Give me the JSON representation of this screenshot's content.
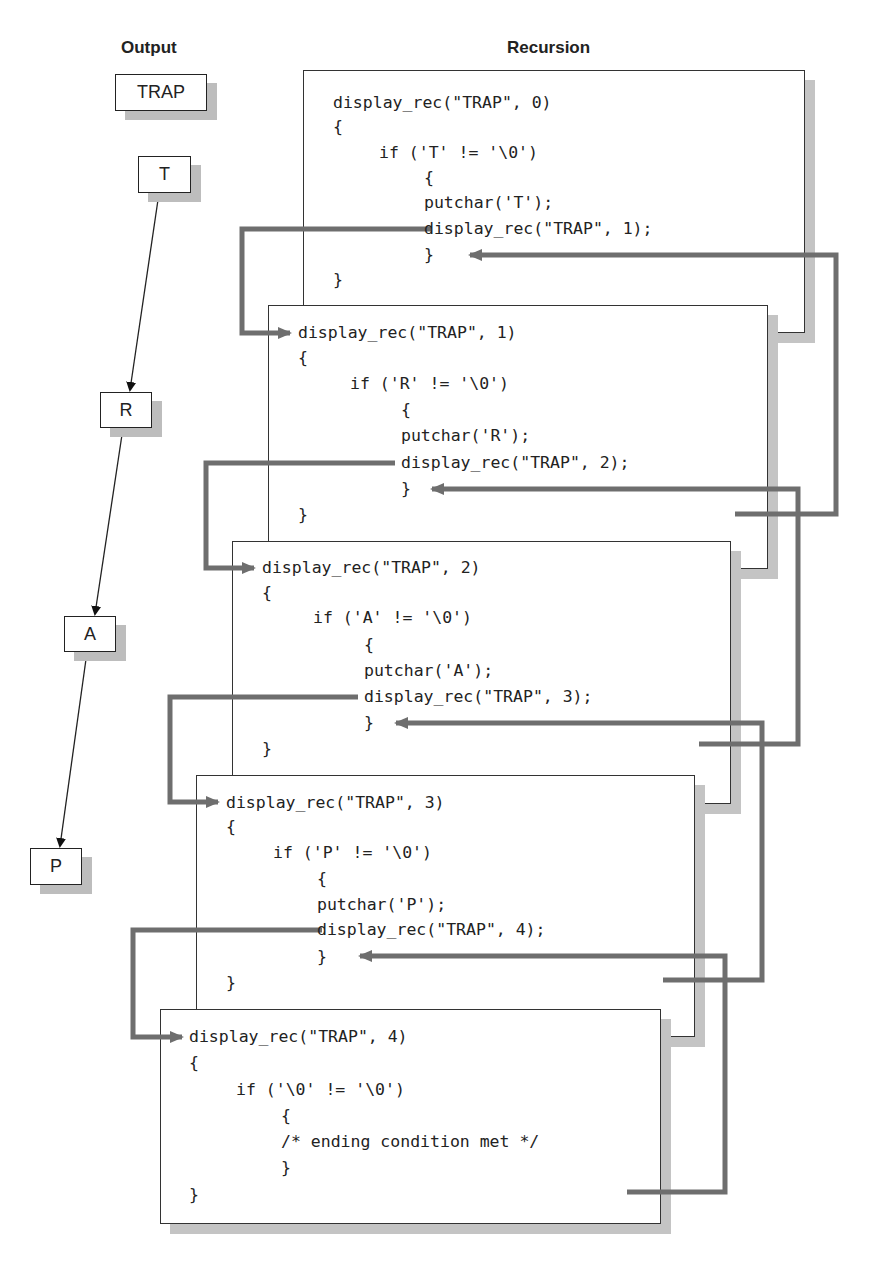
{
  "headings": {
    "output": "Output",
    "recursion": "Recursion"
  },
  "output": {
    "result": "TRAP",
    "chars": [
      "T",
      "R",
      "A",
      "P"
    ]
  },
  "frames": [
    {
      "header": "display_rec(\"TRAP\", 0)",
      "open_brace": "{",
      "condition": "if ('T' != '\\0')",
      "inner_open": "{",
      "body1": "putchar('T');",
      "body2": "display_rec(\"TRAP\", 1);",
      "inner_close": "}",
      "close_brace": "}"
    },
    {
      "header": "display_rec(\"TRAP\", 1)",
      "open_brace": "{",
      "condition": "if ('R' != '\\0')",
      "inner_open": "{",
      "body1": "putchar('R');",
      "body2": "display_rec(\"TRAP\", 2);",
      "inner_close": "}",
      "close_brace": "}"
    },
    {
      "header": "display_rec(\"TRAP\", 2)",
      "open_brace": "{",
      "condition": "if ('A' != '\\0')",
      "inner_open": "{",
      "body1": "putchar('A');",
      "body2": "display_rec(\"TRAP\", 3);",
      "inner_close": "}",
      "close_brace": "}"
    },
    {
      "header": "display_rec(\"TRAP\", 3)",
      "open_brace": "{",
      "condition": "if ('P' != '\\0')",
      "inner_open": "{",
      "body1": "putchar('P');",
      "body2": "display_rec(\"TRAP\", 4);",
      "inner_close": "}",
      "close_brace": "}"
    },
    {
      "header": "display_rec(\"TRAP\", 4)",
      "open_brace": "{",
      "condition": "if ('\\0' != '\\0')",
      "inner_open": "{",
      "body1": "/* ending condition met */",
      "inner_close": "}",
      "close_brace": "}"
    }
  ],
  "colors": {
    "connector": "#6e6e6e",
    "shadow": "#c4c4c4",
    "border": "#333333"
  }
}
